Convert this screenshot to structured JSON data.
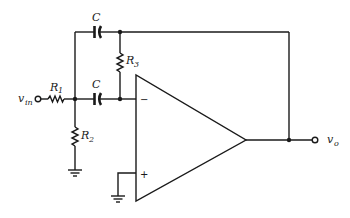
{
  "diagram": {
    "type": "circuit-schematic",
    "colors": {
      "ink": "#1a1a1a",
      "background": "#ffffff"
    },
    "labels": {
      "vin_main": "v",
      "vin_sub": "in",
      "vo_main": "v",
      "vo_sub": "o",
      "r1_main": "R",
      "r1_sub": "1",
      "r2_main": "R",
      "r2_sub": "2",
      "r3_main": "R",
      "r3_sub": "3",
      "c_top": "C",
      "c_bottom": "C",
      "inverting_sign": "−",
      "noninverting_sign": "+"
    },
    "components": [
      {
        "id": "R1",
        "type": "resistor",
        "from": "vin",
        "to": "node_A"
      },
      {
        "id": "R2",
        "type": "resistor",
        "from": "node_A",
        "to": "ground"
      },
      {
        "id": "C_top",
        "type": "capacitor",
        "from": "node_A",
        "to": "node_B_top"
      },
      {
        "id": "R3",
        "type": "resistor",
        "from": "node_B_top",
        "to": "inverting_input"
      },
      {
        "id": "C_bottom",
        "type": "capacitor",
        "from": "node_A",
        "to": "inverting_input"
      },
      {
        "id": "opamp",
        "type": "op-amp",
        "inverting": "inverting_input",
        "noninverting": "ground",
        "output": "vo"
      }
    ],
    "nodes": [
      "vin",
      "node_A",
      "node_B_top",
      "inverting_input",
      "vo",
      "ground"
    ]
  }
}
